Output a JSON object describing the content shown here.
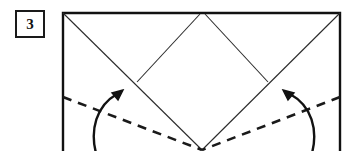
{
  "figure": {
    "kind": "origami-fold-diagram",
    "step_number": "3",
    "width": 352,
    "height": 151,
    "background_color": "#ffffff",
    "line_color": "#1a1a1a",
    "crease_color": "#444444",
    "border_color": "#111111"
  },
  "paper": {
    "name": "paper-sheet-outline",
    "shape": "rectangle",
    "left": 63,
    "top": 13,
    "right": 340,
    "bottom": 151,
    "border_width": 2.4,
    "note": "bottom edge is cropped by the image frame"
  },
  "creases": [
    {
      "name": "valley-diagonal-left",
      "style": "solid",
      "from_x": 63,
      "from_y": 13,
      "to_x": 202,
      "to_y": 150
    },
    {
      "name": "valley-diagonal-right",
      "style": "solid",
      "from_x": 340,
      "from_y": 13,
      "to_x": 202,
      "to_y": 150
    },
    {
      "name": "diamond-upper-left-edge",
      "style": "solid",
      "from_x": 137,
      "from_y": 82,
      "to_x": 200,
      "to_y": 14
    },
    {
      "name": "diamond-upper-right-edge",
      "style": "solid",
      "from_x": 205,
      "from_y": 14,
      "to_x": 268,
      "to_y": 82
    },
    {
      "name": "fold-line-left",
      "style": "dashed",
      "from_x": 63,
      "from_y": 97,
      "to_x": 202,
      "to_y": 150,
      "dash_pattern": "9 7"
    },
    {
      "name": "fold-line-right",
      "style": "dashed",
      "from_x": 340,
      "from_y": 97,
      "to_x": 202,
      "to_y": 150,
      "dash_pattern": "9 7"
    }
  ],
  "arrows": [
    {
      "name": "fold-arrow-left",
      "direction": "up-right",
      "tail_x": 96,
      "tail_y": 152,
      "tip_x": 122,
      "tip_y": 91,
      "curve": "counter-clockwise"
    },
    {
      "name": "fold-arrow-right",
      "direction": "up-left",
      "tail_x": 312,
      "tail_y": 152,
      "tip_x": 283,
      "tip_y": 91,
      "curve": "clockwise"
    }
  ]
}
